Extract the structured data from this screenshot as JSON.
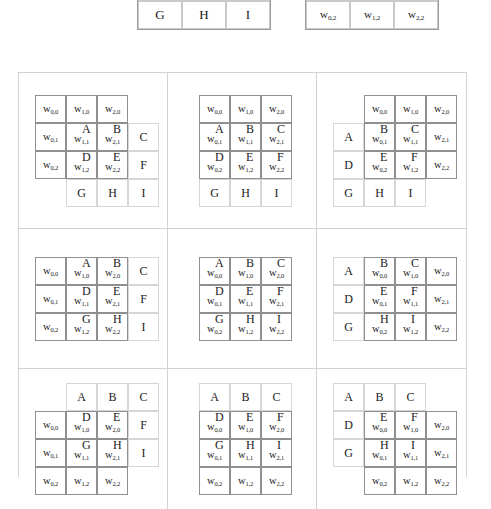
{
  "figure": {
    "image_letters": [
      "A",
      "B",
      "C",
      "D",
      "E",
      "F",
      "G",
      "H",
      "I"
    ],
    "kernel_symbol": "w",
    "operators": {
      "convolve": "*",
      "equals": "="
    }
  },
  "header": {
    "image_matrix": {
      "visible_rows": [
        [
          "D",
          "E",
          "F"
        ],
        [
          "G",
          "H",
          "I"
        ]
      ]
    },
    "operator_convolve": "*",
    "kernel_matrix": {
      "visible_rows": [
        [
          {
            "base": "w",
            "sub": "0,1"
          },
          {
            "base": "w",
            "sub": "1,1"
          },
          {
            "base": "w",
            "sub": "2,1"
          }
        ],
        [
          {
            "base": "w",
            "sub": "0,2"
          },
          {
            "base": "w",
            "sub": "1,2"
          },
          {
            "base": "w",
            "sub": "2,2"
          }
        ]
      ]
    },
    "operator_equals": "="
  },
  "kernel_labels": [
    [
      {
        "base": "w",
        "sub": "0,0"
      },
      {
        "base": "w",
        "sub": "1,0"
      },
      {
        "base": "w",
        "sub": "2,0"
      }
    ],
    [
      {
        "base": "w",
        "sub": "0,1"
      },
      {
        "base": "w",
        "sub": "1,1"
      },
      {
        "base": "w",
        "sub": "2,1"
      }
    ],
    [
      {
        "base": "w",
        "sub": "0,2"
      },
      {
        "base": "w",
        "sub": "1,2"
      },
      {
        "base": "w",
        "sub": "2,2"
      }
    ]
  ],
  "image_rows": [
    [
      "A",
      "B",
      "C"
    ],
    [
      "D",
      "E",
      "F"
    ],
    [
      "G",
      "H",
      "I"
    ]
  ],
  "panels": [
    {
      "index": 1,
      "name": "panel-shift-left-up",
      "kernel_offset": {
        "dx": -1,
        "dy": -1
      },
      "overlap_letters": [
        {
          "row": 1,
          "col": 1,
          "letter": "A"
        },
        {
          "row": 1,
          "col": 2,
          "letter": "B"
        },
        {
          "row": 2,
          "col": 1,
          "letter": "D"
        },
        {
          "row": 2,
          "col": 2,
          "letter": "E"
        }
      ]
    },
    {
      "index": 2,
      "name": "panel-shift-center-up",
      "kernel_offset": {
        "dx": 0,
        "dy": -1
      },
      "overlap_letters": [
        {
          "row": 1,
          "col": 0,
          "letter": "A"
        },
        {
          "row": 1,
          "col": 1,
          "letter": "B"
        },
        {
          "row": 1,
          "col": 2,
          "letter": "C"
        },
        {
          "row": 2,
          "col": 0,
          "letter": "D"
        },
        {
          "row": 2,
          "col": 1,
          "letter": "E"
        },
        {
          "row": 2,
          "col": 2,
          "letter": "F"
        }
      ]
    },
    {
      "index": 3,
      "name": "panel-shift-right-up",
      "kernel_offset": {
        "dx": 1,
        "dy": -1
      },
      "overlap_letters": [
        {
          "row": 1,
          "col": 0,
          "letter": "B"
        },
        {
          "row": 1,
          "col": 1,
          "letter": "C"
        },
        {
          "row": 2,
          "col": 0,
          "letter": "E"
        },
        {
          "row": 2,
          "col": 1,
          "letter": "F"
        }
      ]
    },
    {
      "index": 4,
      "name": "panel-shift-left-center",
      "kernel_offset": {
        "dx": -1,
        "dy": 0
      },
      "overlap_letters": [
        {
          "row": 0,
          "col": 1,
          "letter": "A"
        },
        {
          "row": 0,
          "col": 2,
          "letter": "B"
        },
        {
          "row": 1,
          "col": 1,
          "letter": "D"
        },
        {
          "row": 1,
          "col": 2,
          "letter": "E"
        },
        {
          "row": 2,
          "col": 1,
          "letter": "G"
        },
        {
          "row": 2,
          "col": 2,
          "letter": "H"
        }
      ]
    },
    {
      "index": 5,
      "name": "panel-center-full-overlap",
      "kernel_offset": {
        "dx": 0,
        "dy": 0
      },
      "overlap_letters": [
        {
          "row": 0,
          "col": 0,
          "letter": "A"
        },
        {
          "row": 0,
          "col": 1,
          "letter": "B"
        },
        {
          "row": 0,
          "col": 2,
          "letter": "C"
        },
        {
          "row": 1,
          "col": 0,
          "letter": "D"
        },
        {
          "row": 1,
          "col": 1,
          "letter": "E"
        },
        {
          "row": 1,
          "col": 2,
          "letter": "F"
        },
        {
          "row": 2,
          "col": 0,
          "letter": "G"
        },
        {
          "row": 2,
          "col": 1,
          "letter": "H"
        },
        {
          "row": 2,
          "col": 2,
          "letter": "I"
        }
      ]
    },
    {
      "index": 6,
      "name": "panel-shift-right-center",
      "kernel_offset": {
        "dx": 1,
        "dy": 0
      },
      "overlap_letters": [
        {
          "row": 0,
          "col": 0,
          "letter": "B"
        },
        {
          "row": 0,
          "col": 1,
          "letter": "C"
        },
        {
          "row": 1,
          "col": 0,
          "letter": "E"
        },
        {
          "row": 1,
          "col": 1,
          "letter": "F"
        },
        {
          "row": 2,
          "col": 0,
          "letter": "H"
        },
        {
          "row": 2,
          "col": 1,
          "letter": "I"
        }
      ]
    },
    {
      "index": 7,
      "name": "panel-shift-left-down",
      "kernel_offset": {
        "dx": -1,
        "dy": 1
      },
      "overlap_letters": [
        {
          "row": 0,
          "col": 1,
          "letter": "D"
        },
        {
          "row": 0,
          "col": 2,
          "letter": "E"
        },
        {
          "row": 1,
          "col": 1,
          "letter": "G"
        },
        {
          "row": 1,
          "col": 2,
          "letter": "H"
        }
      ]
    },
    {
      "index": 8,
      "name": "panel-shift-center-down",
      "kernel_offset": {
        "dx": 0,
        "dy": 1
      },
      "overlap_letters": [
        {
          "row": 0,
          "col": 0,
          "letter": "D"
        },
        {
          "row": 0,
          "col": 1,
          "letter": "E"
        },
        {
          "row": 0,
          "col": 2,
          "letter": "F"
        },
        {
          "row": 1,
          "col": 0,
          "letter": "G"
        },
        {
          "row": 1,
          "col": 1,
          "letter": "H"
        },
        {
          "row": 1,
          "col": 2,
          "letter": "I"
        }
      ]
    },
    {
      "index": 9,
      "name": "panel-shift-right-down",
      "kernel_offset": {
        "dx": 1,
        "dy": 1
      },
      "overlap_letters": [
        {
          "row": 0,
          "col": 0,
          "letter": "E"
        },
        {
          "row": 0,
          "col": 1,
          "letter": "F"
        },
        {
          "row": 1,
          "col": 0,
          "letter": "H"
        },
        {
          "row": 1,
          "col": 1,
          "letter": "I"
        }
      ]
    }
  ],
  "colors": {
    "background": "#ffffff",
    "text": "#1a1a1a",
    "image_grid_line": "#d6d6d6",
    "kernel_grid_line": "#8f8f8f",
    "panel_divider": "#d2d2d2"
  }
}
